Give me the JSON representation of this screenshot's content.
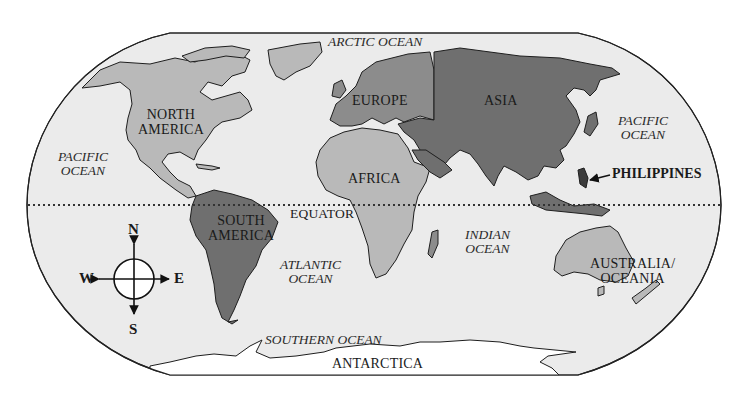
{
  "map": {
    "colors": {
      "background": "#ffffff",
      "ocean": "#ebebeb",
      "outline": "#222222",
      "land_light": "#b9b9b9",
      "land_medium": "#8c8c8c",
      "land_dark": "#6f6f6f",
      "antarctica": "#ffffff",
      "equator_line": "#333333"
    },
    "continents": {
      "north_america": [
        "NORTH",
        "AMERICA"
      ],
      "south_america": [
        "SOUTH",
        "AMERICA"
      ],
      "europe": "EUROPE",
      "asia": "ASIA",
      "africa": "AFRICA",
      "australia": [
        "AUSTRALIA/",
        "OCEANIA"
      ],
      "antarctica": "ANTARCTICA"
    },
    "oceans": {
      "arctic": "ARCTIC OCEAN",
      "pacific_west": [
        "PACIFIC",
        "OCEAN"
      ],
      "pacific_east": [
        "PACIFIC",
        "OCEAN"
      ],
      "atlantic": [
        "ATLANTIC",
        "OCEAN"
      ],
      "indian": [
        "INDIAN",
        "OCEAN"
      ],
      "southern": "SOUTHERN OCEAN"
    },
    "lines": {
      "equator": "EQUATOR"
    },
    "callouts": {
      "philippines": "PHILIPPINES"
    },
    "compass": {
      "north": "N",
      "south": "S",
      "east": "E",
      "west": "W"
    }
  }
}
